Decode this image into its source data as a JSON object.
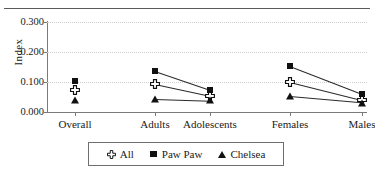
{
  "chart_data": {
    "type": "line",
    "title": "",
    "subtitle": "",
    "xlabel": "",
    "ylabel": "Index",
    "categories": [
      "Overall",
      "Adults",
      "Adolescents",
      "Females",
      "Males"
    ],
    "ylim": [
      0.0,
      0.3
    ],
    "yticks": [
      "0.000",
      "0.100",
      "0.200",
      "0.300"
    ],
    "ytick_values": [
      0.0,
      0.1,
      0.2,
      0.3
    ],
    "grid": true,
    "legend_position": "bottom",
    "series": [
      {
        "name": "All",
        "marker": "cross-outline",
        "color": "#111111",
        "values": [
          0.073,
          0.094,
          0.055,
          0.1,
          0.04
        ]
      },
      {
        "name": "Paw Paw",
        "marker": "square-filled",
        "color": "#111111",
        "values": [
          0.105,
          0.137,
          0.074,
          0.152,
          0.059
        ]
      },
      {
        "name": "Chelsea",
        "marker": "triangle-filled",
        "color": "#111111",
        "values": [
          0.04,
          0.045,
          0.039,
          0.052,
          0.031
        ]
      }
    ],
    "segments_drawn": [
      {
        "series": "All",
        "from": "Adults",
        "to": "Adolescents"
      },
      {
        "series": "All",
        "from": "Females",
        "to": "Males"
      },
      {
        "series": "Paw Paw",
        "from": "Adults",
        "to": "Adolescents"
      },
      {
        "series": "Paw Paw",
        "from": "Females",
        "to": "Males"
      },
      {
        "series": "Chelsea",
        "from": "Adults",
        "to": "Adolescents"
      },
      {
        "series": "Chelsea",
        "from": "Females",
        "to": "Males"
      }
    ]
  },
  "legend": {
    "items": [
      {
        "label": "All",
        "symbol": "cross-outline"
      },
      {
        "label": "Paw Paw",
        "symbol": "square-filled"
      },
      {
        "label": "Chelsea",
        "symbol": "triangle-filled"
      }
    ]
  },
  "axis": {
    "y_title": "Index"
  },
  "colors": {
    "marker": "#111111",
    "axis": "#7a7a7a",
    "grid": "#cfcfcf",
    "rule": "#5a5a5a",
    "background": "#ffffff"
  }
}
